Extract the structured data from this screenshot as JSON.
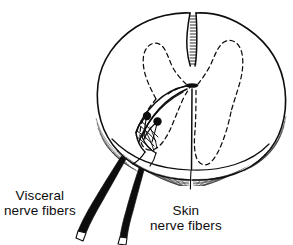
{
  "figure": {
    "background_color": "#ffffff",
    "ink_color": "#0d0d0d"
  },
  "labels": {
    "visceral": {
      "line1": "Visceral",
      "line2": "nerve fibers",
      "full": "Visceral nerve fibers"
    },
    "skin": {
      "line1": "Skin",
      "line2": "nerve fibers",
      "full": "Skin nerve fibers"
    }
  },
  "anatomy": {
    "cord_outline": "spinal-cord-outline",
    "posterior_median_sulcus": "posterior-median-sulcus",
    "anterior_median_fissure": "anterior-median-fissure",
    "gray_matter": "gray-matter-dashed-outline",
    "central_canal": "central-canal",
    "cut_surface_shading": "cut-surface-hatching",
    "neuron_cell_bodies": [
      {
        "name": "neuron-cell-body-1",
        "cx": 147,
        "cy": 116,
        "r": 4.2
      },
      {
        "name": "neuron-cell-body-2",
        "cx": 157.5,
        "cy": 121.5,
        "r": 4.2
      }
    ],
    "fiber_tracts": "ascending-fiber-tracts",
    "visceral_nerve_root": "visceral-nerve-fiber-root",
    "skin_nerve_root": "skin-nerve-fiber-root"
  }
}
